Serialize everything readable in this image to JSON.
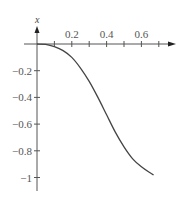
{
  "chart_data": {
    "type": "line",
    "title": "",
    "xlabel": "",
    "ylabel": "x",
    "xlim": [
      0,
      0.77
    ],
    "ylim": [
      -1.08,
      0.08
    ],
    "grid": false,
    "legend": null,
    "x_ticks": [
      0.1,
      0.2,
      0.3,
      0.4,
      0.5,
      0.6,
      0.7
    ],
    "x_tick_labels": [
      "0.2",
      "0.4",
      "0.6"
    ],
    "x_tick_label_values": [
      0.2,
      0.4,
      0.6
    ],
    "y_ticks": [
      -0.2,
      -0.4,
      -0.6,
      -0.8,
      -1
    ],
    "y_tick_labels": [
      "−0.2",
      "−0.4",
      "−0.6",
      "−0.8",
      "−1"
    ],
    "series": [
      {
        "name": "x",
        "color": "#444444",
        "x": [
          0,
          0.05,
          0.1,
          0.15,
          0.2,
          0.25,
          0.3,
          0.35,
          0.4,
          0.45,
          0.5,
          0.55,
          0.6,
          0.65,
          0.67
        ],
        "y": [
          0,
          -0.003,
          -0.02,
          -0.05,
          -0.1,
          -0.18,
          -0.28,
          -0.4,
          -0.53,
          -0.66,
          -0.77,
          -0.86,
          -0.92,
          -0.965,
          -0.98
        ]
      }
    ]
  },
  "colors": {
    "axis": "#555555",
    "curve": "#444444",
    "background": "#ffffff"
  }
}
